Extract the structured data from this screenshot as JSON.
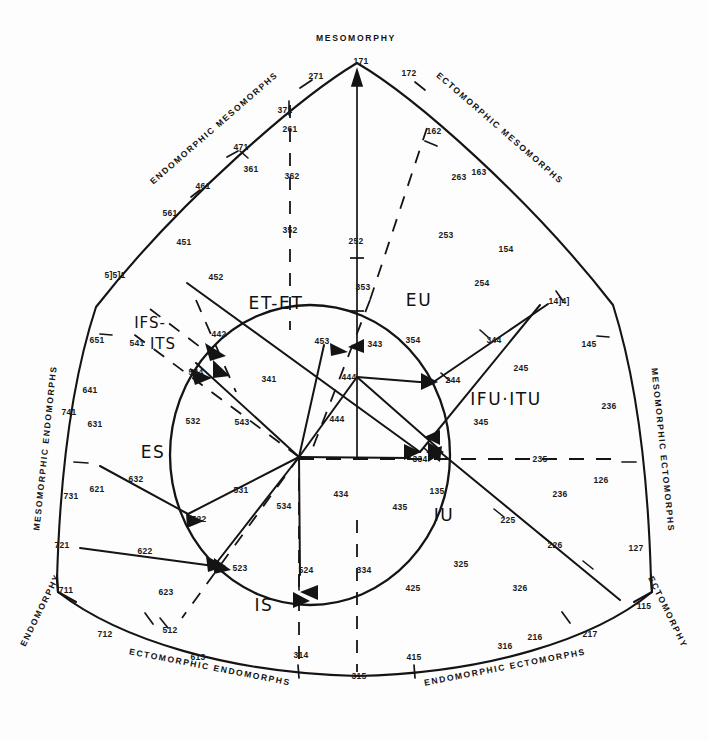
{
  "chart_data": {
    "type": "diagram",
    "apex_labels": [
      {
        "text": "MESOMORPHY",
        "x": 356,
        "y": 38,
        "rot": 0
      },
      {
        "text": "ENDOMORPHY",
        "x": 40,
        "y": 610,
        "rot": -64
      },
      {
        "text": "ECTOMORPHY",
        "x": 668,
        "y": 612,
        "rot": 64
      }
    ],
    "edge_labels": [
      {
        "text": "ENDOMORPHIC  MESOMORPHS",
        "x": 214,
        "y": 128,
        "rot": -41
      },
      {
        "text": "ECTOMORPHIC  MESOMORPHS",
        "x": 500,
        "y": 128,
        "rot": 41
      },
      {
        "text": "MESOMORPHIC  ENDOMORPHS",
        "x": 45,
        "y": 448,
        "rot": -84
      },
      {
        "text": "MESOMORPHIC  ECTOMORPHS",
        "x": 663,
        "y": 450,
        "rot": 84
      },
      {
        "text": "ECTOMORPHIC  ENDOMORPHS",
        "x": 210,
        "y": 667,
        "rot": 11
      },
      {
        "text": "ENDOMORPHIC  ECTOMORPHS",
        "x": 505,
        "y": 667,
        "rot": -11
      }
    ],
    "region_labels": [
      {
        "text": "ET-ET",
        "x": 276,
        "y": 303,
        "size": "big"
      },
      {
        "text": "EU",
        "x": 419,
        "y": 300,
        "size": "big"
      },
      {
        "text": "IFS-",
        "x": 150,
        "y": 323,
        "size": "small"
      },
      {
        "text": "ITS",
        "x": 163,
        "y": 344,
        "size": "small"
      },
      {
        "text": "ES",
        "x": 153,
        "y": 452,
        "size": "big"
      },
      {
        "text": "IFU·ITU",
        "x": 506,
        "y": 399,
        "size": "big"
      },
      {
        "text": "IS",
        "x": 264,
        "y": 605,
        "size": "big"
      },
      {
        "text": "IU",
        "x": 444,
        "y": 515,
        "size": "big"
      }
    ],
    "numbers": [
      {
        "v": "171",
        "x": 361,
        "y": 61
      },
      {
        "v": "271",
        "x": 316,
        "y": 76
      },
      {
        "v": "172",
        "x": 409,
        "y": 73
      },
      {
        "v": "371",
        "x": 285,
        "y": 110
      },
      {
        "v": "261",
        "x": 290,
        "y": 129
      },
      {
        "v": "162",
        "x": 434,
        "y": 131
      },
      {
        "v": "471",
        "x": 241,
        "y": 147
      },
      {
        "v": "361",
        "x": 251,
        "y": 169
      },
      {
        "v": "362",
        "x": 292,
        "y": 176
      },
      {
        "v": "263",
        "x": 459,
        "y": 177
      },
      {
        "v": "163",
        "x": 479,
        "y": 172
      },
      {
        "v": "461",
        "x": 203,
        "y": 186
      },
      {
        "v": "561",
        "x": 170,
        "y": 213
      },
      {
        "v": "451",
        "x": 184,
        "y": 242
      },
      {
        "v": "352",
        "x": 290,
        "y": 230
      },
      {
        "v": "252",
        "x": 356,
        "y": 241
      },
      {
        "v": "253",
        "x": 446,
        "y": 235
      },
      {
        "v": "154",
        "x": 506,
        "y": 249
      },
      {
        "v": "5]5]1",
        "x": 115,
        "y": 275
      },
      {
        "v": "452",
        "x": 216,
        "y": 277
      },
      {
        "v": "254",
        "x": 482,
        "y": 283
      },
      {
        "v": "353",
        "x": 363,
        "y": 287
      },
      {
        "v": "14]4]",
        "x": 559,
        "y": 301
      },
      {
        "v": "651",
        "x": 97,
        "y": 340
      },
      {
        "v": "541",
        "x": 137,
        "y": 343
      },
      {
        "v": "442",
        "x": 219,
        "y": 334
      },
      {
        "v": "453",
        "x": 322,
        "y": 341
      },
      {
        "v": "343",
        "x": 375,
        "y": 344
      },
      {
        "v": "354",
        "x": 413,
        "y": 340
      },
      {
        "v": "344",
        "x": 494,
        "y": 340
      },
      {
        "v": "145",
        "x": 589,
        "y": 344
      },
      {
        "v": "245",
        "x": 521,
        "y": 368
      },
      {
        "v": "544",
        "x": 196,
        "y": 372
      },
      {
        "v": "341",
        "x": 269,
        "y": 379
      },
      {
        "v": "444",
        "x": 349,
        "y": 377
      },
      {
        "v": "244",
        "x": 453,
        "y": 380
      },
      {
        "v": "641",
        "x": 90,
        "y": 390
      },
      {
        "v": "741",
        "x": 69,
        "y": 412
      },
      {
        "v": "631",
        "x": 95,
        "y": 424
      },
      {
        "v": "345",
        "x": 481,
        "y": 422
      },
      {
        "v": "236",
        "x": 609,
        "y": 406
      },
      {
        "v": "543",
        "x": 242,
        "y": 422
      },
      {
        "v": "532",
        "x": 193,
        "y": 421
      },
      {
        "v": "444",
        "x": 337,
        "y": 419
      },
      {
        "v": "334",
        "x": 420,
        "y": 459
      },
      {
        "v": "235",
        "x": 540,
        "y": 459
      },
      {
        "v": "731",
        "x": 71,
        "y": 496
      },
      {
        "v": "621",
        "x": 97,
        "y": 489
      },
      {
        "v": "632",
        "x": 136,
        "y": 479
      },
      {
        "v": "531",
        "x": 241,
        "y": 490
      },
      {
        "v": "534",
        "x": 284,
        "y": 506
      },
      {
        "v": "434",
        "x": 341,
        "y": 494
      },
      {
        "v": "435",
        "x": 400,
        "y": 507
      },
      {
        "v": "135",
        "x": 437,
        "y": 491
      },
      {
        "v": "236",
        "x": 560,
        "y": 494
      },
      {
        "v": "126",
        "x": 601,
        "y": 480
      },
      {
        "v": "721",
        "x": 62,
        "y": 545
      },
      {
        "v": "522",
        "x": 199,
        "y": 519
      },
      {
        "v": "225",
        "x": 508,
        "y": 520
      },
      {
        "v": "226",
        "x": 555,
        "y": 545
      },
      {
        "v": "127",
        "x": 636,
        "y": 548
      },
      {
        "v": "622",
        "x": 145,
        "y": 551
      },
      {
        "v": "523",
        "x": 240,
        "y": 568
      },
      {
        "v": "325",
        "x": 461,
        "y": 564
      },
      {
        "v": "711",
        "x": 66,
        "y": 590
      },
      {
        "v": "623",
        "x": 166,
        "y": 592
      },
      {
        "v": "524",
        "x": 306,
        "y": 570
      },
      {
        "v": "334",
        "x": 364,
        "y": 570
      },
      {
        "v": "425",
        "x": 413,
        "y": 588
      },
      {
        "v": "326",
        "x": 520,
        "y": 588
      },
      {
        "v": "115",
        "x": 644,
        "y": 606
      },
      {
        "v": "712",
        "x": 105,
        "y": 634
      },
      {
        "v": "512",
        "x": 170,
        "y": 630
      },
      {
        "v": "613",
        "x": 198,
        "y": 657
      },
      {
        "v": "314",
        "x": 301,
        "y": 655
      },
      {
        "v": "415",
        "x": 414,
        "y": 657
      },
      {
        "v": "316",
        "x": 505,
        "y": 646
      },
      {
        "v": "216",
        "x": 535,
        "y": 637
      },
      {
        "v": "217",
        "x": 590,
        "y": 634
      },
      {
        "v": "315",
        "x": 359,
        "y": 676
      }
    ],
    "axis_ranges": {
      "x": [
        0,
        708
      ],
      "y": [
        0,
        741
      ]
    },
    "grid": false,
    "legend": "none"
  }
}
